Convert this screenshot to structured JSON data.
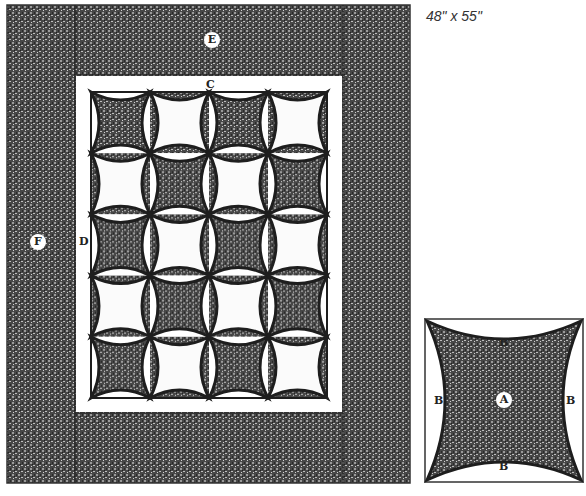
{
  "quilt": {
    "size_label": "48\" x 55\"",
    "labels": {
      "outer_border_top": "E",
      "outer_border_side": "F",
      "inner_border_side": "D",
      "inner_border_top": "C"
    },
    "grid": {
      "columns": 4,
      "rows": 5
    },
    "block_pattern": "checkerboard, top-left block has dark center"
  },
  "block_detail": {
    "center_label": "A",
    "side_labels": [
      "B",
      "B",
      "B",
      "B"
    ]
  },
  "colors": {
    "dark_print": "#4a4a4a",
    "outline": "#1e1e1e",
    "background": "#ffffff",
    "light_fill": "#fbfbfb"
  }
}
